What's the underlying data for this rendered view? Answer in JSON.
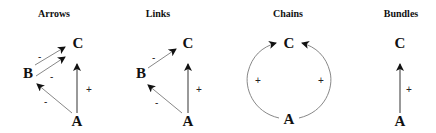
{
  "panels": [
    {
      "title": "Arrows",
      "nodes": {
        "a": "A",
        "b": "B",
        "c": "C"
      },
      "edges": [
        {
          "from": "A",
          "to": "C",
          "sign": "+"
        },
        {
          "from": "A",
          "to": "B",
          "sign": "-"
        },
        {
          "from": "B",
          "to": "C",
          "sign": "-"
        },
        {
          "from": "B",
          "to": "C",
          "sign": "-"
        }
      ],
      "signs": [
        "+",
        "-",
        "-",
        "-"
      ]
    },
    {
      "title": "Links",
      "nodes": {
        "a": "A",
        "b": "B",
        "c": "C"
      },
      "edges": [
        {
          "from": "A",
          "to": "C",
          "sign": "+"
        },
        {
          "from": "A",
          "to": "B",
          "sign": "-"
        },
        {
          "from": "B",
          "to": "C",
          "sign": "-"
        }
      ],
      "signs": [
        "+",
        "-",
        "-"
      ]
    },
    {
      "title": "Chains",
      "nodes": {
        "a": "A",
        "c": "C"
      },
      "edges": [
        {
          "from": "A",
          "to": "C",
          "sign": "+",
          "path": "left-arc"
        },
        {
          "from": "A",
          "to": "C",
          "sign": "+",
          "path": "right-arc"
        }
      ],
      "signs": [
        "+",
        "+"
      ]
    },
    {
      "title": "Bundles",
      "nodes": {
        "a": "A",
        "c": "C"
      },
      "edges": [
        {
          "from": "A",
          "to": "C",
          "sign": "+"
        }
      ],
      "signs": [
        "+"
      ]
    }
  ]
}
